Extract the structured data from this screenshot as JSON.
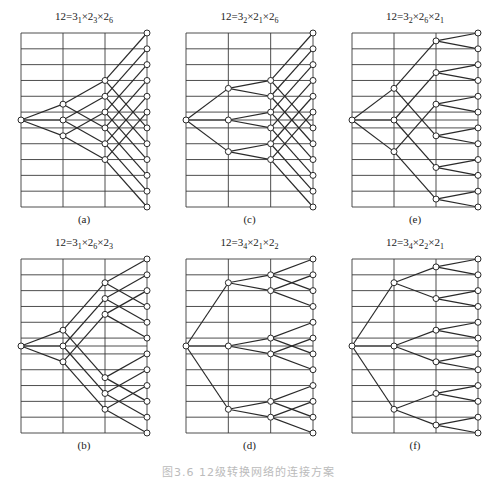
{
  "figure": {
    "caption": "图3.6  12级转换网络的连接方案",
    "levels": 12,
    "panels": [
      {
        "id": "a",
        "label": "(a)",
        "title_base": "12=",
        "factors": [
          {
            "n": "3",
            "s": "1"
          },
          {
            "n": "2",
            "s": "3"
          },
          {
            "n": "2",
            "s": "6"
          }
        ],
        "title": "12=3₁×2₃×2₆",
        "box": {
          "x": 21,
          "y": 33,
          "w": 126,
          "h": 174
        },
        "title_y": 10,
        "label_y": 213,
        "col1": [
          4.5,
          5.5,
          6.5
        ],
        "col1_offset": 1.5,
        "col2_offset": 3
      },
      {
        "id": "c",
        "label": "(c)",
        "factors": [
          {
            "n": "3",
            "s": "2"
          },
          {
            "n": "2",
            "s": "1"
          },
          {
            "n": "2",
            "s": "6"
          }
        ],
        "title": "12=3₂×2₁×2₆",
        "box": {
          "x": 186,
          "y": 33,
          "w": 127,
          "h": 174
        },
        "title_y": 10,
        "label_y": 213,
        "col1": [
          3.5,
          5.5,
          7.5
        ],
        "col1_offset": 0.5,
        "col2_offset": 3
      },
      {
        "id": "e",
        "label": "(e)",
        "factors": [
          {
            "n": "3",
            "s": "2"
          },
          {
            "n": "2",
            "s": "6"
          },
          {
            "n": "2",
            "s": "1"
          }
        ],
        "title": "12=3₂×2₆×2₁",
        "box": {
          "x": 352,
          "y": 33,
          "w": 126,
          "h": 174
        },
        "title_y": 10,
        "label_y": 213,
        "col1": [
          3.5,
          5.5,
          7.5
        ],
        "col1_offset": 3,
        "col2_offset": 0.5
      },
      {
        "id": "b",
        "label": "(b)",
        "factors": [
          {
            "n": "3",
            "s": "1"
          },
          {
            "n": "2",
            "s": "6"
          },
          {
            "n": "2",
            "s": "3"
          }
        ],
        "title": "12=3₁×2₆×2₃",
        "box": {
          "x": 21,
          "y": 259,
          "w": 126,
          "h": 174
        },
        "title_y": 236,
        "label_y": 439,
        "col1": [
          4.5,
          5.5,
          6.5
        ],
        "col1_offset": 3,
        "col2_offset": 1.5
      },
      {
        "id": "d",
        "label": "(d)",
        "factors": [
          {
            "n": "3",
            "s": "4"
          },
          {
            "n": "2",
            "s": "1"
          },
          {
            "n": "2",
            "s": "2"
          }
        ],
        "title": "12=3₄×2₁×2₂",
        "box": {
          "x": 186,
          "y": 259,
          "w": 127,
          "h": 174
        },
        "title_y": 236,
        "label_y": 439,
        "col1": [
          1.5,
          5.5,
          9.5
        ],
        "col1_offset": 0.5,
        "col2_offset": 1
      },
      {
        "id": "f",
        "label": "(f)",
        "factors": [
          {
            "n": "3",
            "s": "4"
          },
          {
            "n": "2",
            "s": "2"
          },
          {
            "n": "2",
            "s": "1"
          }
        ],
        "title": "12=3₄×2₂×2₁",
        "box": {
          "x": 352,
          "y": 259,
          "w": 126,
          "h": 174
        },
        "title_y": 236,
        "label_y": 439,
        "col1": [
          1.5,
          5.5,
          9.5
        ],
        "col1_offset": 1,
        "col2_offset": 0.5
      }
    ],
    "style": {
      "line_color": "#2a2a2a",
      "grid_color": "#3a3a3a",
      "node_fill": "#ffffff",
      "node_stroke": "#2a2a2a",
      "node_radius": 3
    }
  }
}
